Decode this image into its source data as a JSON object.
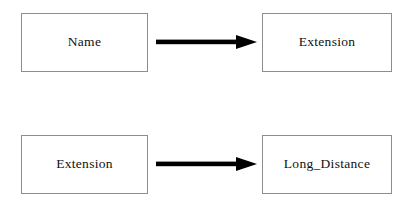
{
  "diagram": {
    "type": "functional-dependency-diagram",
    "background_color": "#ffffff",
    "box_border_color": "#8d8d8d",
    "arrow_color": "#000000",
    "text_color": "#111111",
    "rows": [
      {
        "id": "row-1",
        "source_label": "Name",
        "arrow_icon": "right-arrow-icon",
        "target_label": "Extension"
      },
      {
        "id": "row-2",
        "source_label": "Extension",
        "arrow_icon": "right-arrow-icon",
        "target_label": "Long_Distance"
      }
    ]
  }
}
